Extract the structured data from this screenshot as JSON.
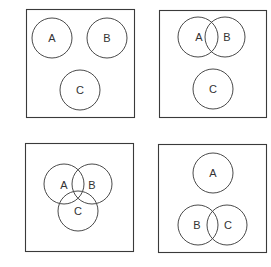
{
  "panels": [
    {
      "id": "panel-1",
      "box": {
        "x": 26,
        "y": 9,
        "w": 108,
        "h": 108
      },
      "circles": [
        {
          "label": "A",
          "cx": 52,
          "cy": 38,
          "r": 20
        },
        {
          "label": "B",
          "cx": 107,
          "cy": 38,
          "r": 20
        },
        {
          "label": "C",
          "cx": 80,
          "cy": 90,
          "r": 20
        }
      ],
      "labels": [
        {
          "text": "A",
          "x": 52,
          "y": 38
        },
        {
          "text": "B",
          "x": 107,
          "y": 38
        },
        {
          "text": "C",
          "x": 80,
          "y": 90
        }
      ]
    },
    {
      "id": "panel-2",
      "box": {
        "x": 159,
        "y": 10,
        "w": 107,
        "h": 107
      },
      "circles": [
        {
          "label": "A",
          "cx": 198,
          "cy": 37,
          "r": 20
        },
        {
          "label": "B",
          "cx": 225,
          "cy": 37,
          "r": 20
        },
        {
          "label": "C",
          "cx": 213,
          "cy": 89,
          "r": 20
        }
      ],
      "labels": [
        {
          "text": "A",
          "x": 199,
          "y": 37
        },
        {
          "text": "B",
          "x": 227,
          "y": 37
        },
        {
          "text": "C",
          "x": 213,
          "y": 89
        }
      ]
    },
    {
      "id": "panel-3",
      "box": {
        "x": 25,
        "y": 143,
        "w": 108,
        "h": 108
      },
      "circles": [
        {
          "label": "A",
          "cx": 64,
          "cy": 184,
          "r": 20
        },
        {
          "label": "B",
          "cx": 92,
          "cy": 184,
          "r": 20
        },
        {
          "label": "C",
          "cx": 78,
          "cy": 211,
          "r": 20
        }
      ],
      "labels": [
        {
          "text": "A",
          "x": 64,
          "y": 185
        },
        {
          "text": "B",
          "x": 92,
          "y": 185
        },
        {
          "text": "C",
          "x": 78,
          "y": 211
        }
      ]
    },
    {
      "id": "panel-4",
      "box": {
        "x": 158,
        "y": 144,
        "w": 108,
        "h": 108
      },
      "circles": [
        {
          "label": "A",
          "cx": 213,
          "cy": 173,
          "r": 20
        },
        {
          "label": "B",
          "cx": 198,
          "cy": 225,
          "r": 20
        },
        {
          "label": "C",
          "cx": 227,
          "cy": 225,
          "r": 20
        }
      ],
      "labels": [
        {
          "text": "A",
          "x": 213,
          "y": 173
        },
        {
          "text": "B",
          "x": 197,
          "y": 225
        },
        {
          "text": "C",
          "x": 228,
          "y": 225
        }
      ]
    }
  ]
}
